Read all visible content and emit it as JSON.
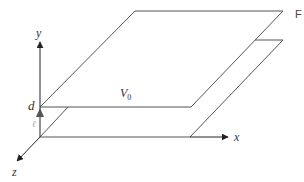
{
  "diagram": {
    "type": "parallel-plate geometry",
    "axes": {
      "x_label": "x",
      "y_label": "y",
      "z_label": "z"
    },
    "labels": {
      "separation": "d",
      "small_gap": "ℓ",
      "plate_potential": "V",
      "plate_potential_sub": "0",
      "corner_letter": "F"
    },
    "colors": {
      "line": "#555555",
      "axis": "#222222",
      "text": "#333333"
    }
  }
}
